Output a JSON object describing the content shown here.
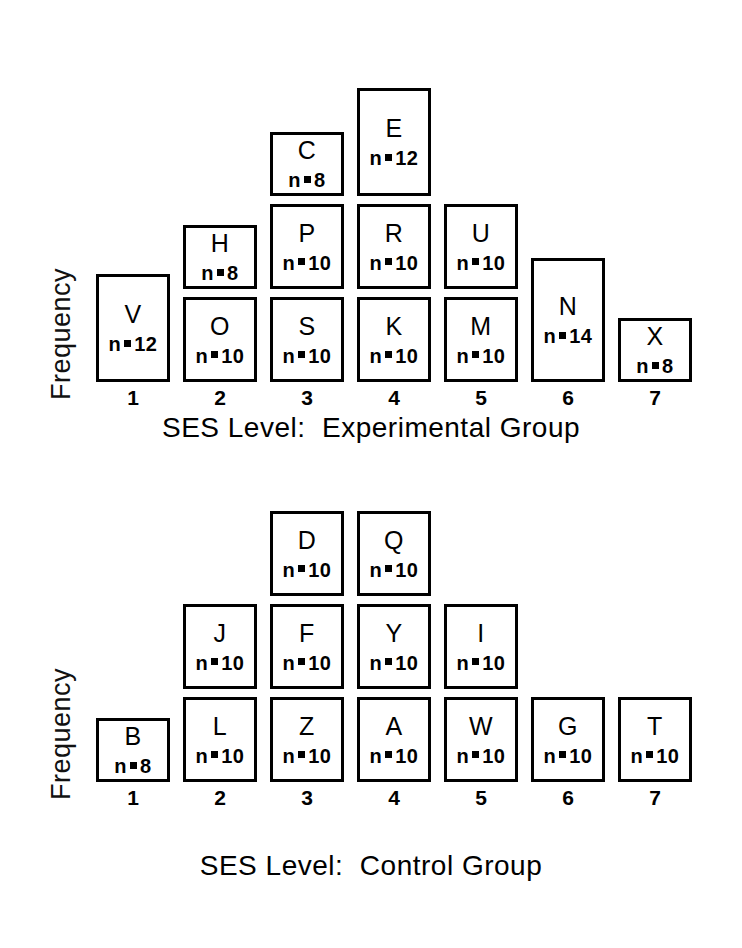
{
  "figure": {
    "background": "#ffffff",
    "ink_color": "#000000"
  },
  "panels": [
    {
      "id": "experimental",
      "ylabel": "Frequency",
      "caption": "SES Level:  Experimental Group",
      "tick_labels": [
        "1",
        "2",
        "3",
        "4",
        "5",
        "6",
        "7"
      ],
      "columns": [
        {
          "level": "1",
          "boxes": [
            {
              "letter": "V",
              "n_prefix": "n",
              "n_value": "12"
            }
          ]
        },
        {
          "level": "2",
          "boxes": [
            {
              "letter": "H",
              "n_prefix": "n",
              "n_value": "8"
            },
            {
              "letter": "O",
              "n_prefix": "n",
              "n_value": "10"
            }
          ]
        },
        {
          "level": "3",
          "boxes": [
            {
              "letter": "C",
              "n_prefix": "n",
              "n_value": "8"
            },
            {
              "letter": "P",
              "n_prefix": "n",
              "n_value": "10"
            },
            {
              "letter": "S",
              "n_prefix": "n",
              "n_value": "10"
            }
          ]
        },
        {
          "level": "4",
          "boxes": [
            {
              "letter": "E",
              "n_prefix": "n",
              "n_value": "12"
            },
            {
              "letter": "R",
              "n_prefix": "n",
              "n_value": "10"
            },
            {
              "letter": "K",
              "n_prefix": "n",
              "n_value": "10"
            }
          ]
        },
        {
          "level": "5",
          "boxes": [
            {
              "letter": "U",
              "n_prefix": "n",
              "n_value": "10"
            },
            {
              "letter": "M",
              "n_prefix": "n",
              "n_value": "10"
            }
          ]
        },
        {
          "level": "6",
          "boxes": [
            {
              "letter": "N",
              "n_prefix": "n",
              "n_value": "14"
            }
          ]
        },
        {
          "level": "7",
          "boxes": [
            {
              "letter": "X",
              "n_prefix": "n",
              "n_value": "8"
            }
          ]
        }
      ]
    },
    {
      "id": "control",
      "ylabel": "Frequency",
      "caption": "SES Level:  Control Group",
      "tick_labels": [
        "1",
        "2",
        "3",
        "4",
        "5",
        "6",
        "7"
      ],
      "columns": [
        {
          "level": "1",
          "boxes": [
            {
              "letter": "B",
              "n_prefix": "n",
              "n_value": "8"
            }
          ]
        },
        {
          "level": "2",
          "boxes": [
            {
              "letter": "J",
              "n_prefix": "n",
              "n_value": "10"
            },
            {
              "letter": "L",
              "n_prefix": "n",
              "n_value": "10"
            }
          ]
        },
        {
          "level": "3",
          "boxes": [
            {
              "letter": "D",
              "n_prefix": "n",
              "n_value": "10"
            },
            {
              "letter": "F",
              "n_prefix": "n",
              "n_value": "10"
            },
            {
              "letter": "Z",
              "n_prefix": "n",
              "n_value": "10"
            }
          ]
        },
        {
          "level": "4",
          "boxes": [
            {
              "letter": "Q",
              "n_prefix": "n",
              "n_value": "10"
            },
            {
              "letter": "Y",
              "n_prefix": "n",
              "n_value": "10"
            },
            {
              "letter": "A",
              "n_prefix": "n",
              "n_value": "10"
            }
          ]
        },
        {
          "level": "5",
          "boxes": [
            {
              "letter": "I",
              "n_prefix": "n",
              "n_value": "10"
            },
            {
              "letter": "W",
              "n_prefix": "n",
              "n_value": "10"
            }
          ]
        },
        {
          "level": "6",
          "boxes": [
            {
              "letter": "G",
              "n_prefix": "n",
              "n_value": "10"
            }
          ]
        },
        {
          "level": "7",
          "boxes": [
            {
              "letter": "T",
              "n_prefix": "n",
              "n_value": "10"
            }
          ]
        }
      ]
    }
  ],
  "chart_data": {
    "type": "bar",
    "title": "",
    "subtitle": "",
    "xlabel": "SES Level",
    "ylabel": "Frequency",
    "grid": false,
    "legend": "none",
    "note": "Two stacked-block frequency charts. Each block is a labelled group (letter code) whose height is proportional to its n. Blocks stack upward from a shared baseline within each SES level column.",
    "categories": [
      "1",
      "2",
      "3",
      "4",
      "5",
      "6",
      "7"
    ],
    "panels": [
      {
        "name": "SES Level:  Experimental Group",
        "xlabel": "SES Level",
        "ylabel": "Frequency",
        "categories": [
          "1",
          "2",
          "3",
          "4",
          "5",
          "6",
          "7"
        ],
        "stacked_totals": [
          12,
          18,
          28,
          32,
          20,
          14,
          8
        ],
        "blocks_by_category": [
          [
            {
              "label": "V",
              "n": 12
            }
          ],
          [
            {
              "label": "O",
              "n": 10
            },
            {
              "label": "H",
              "n": 8
            }
          ],
          [
            {
              "label": "S",
              "n": 10
            },
            {
              "label": "P",
              "n": 10
            },
            {
              "label": "C",
              "n": 8
            }
          ],
          [
            {
              "label": "K",
              "n": 10
            },
            {
              "label": "R",
              "n": 10
            },
            {
              "label": "E",
              "n": 12
            }
          ],
          [
            {
              "label": "M",
              "n": 10
            },
            {
              "label": "U",
              "n": 10
            }
          ],
          [
            {
              "label": "N",
              "n": 14
            }
          ],
          [
            {
              "label": "X",
              "n": 8
            }
          ]
        ]
      },
      {
        "name": "SES Level:  Control Group",
        "xlabel": "SES Level",
        "ylabel": "Frequency",
        "categories": [
          "1",
          "2",
          "3",
          "4",
          "5",
          "6",
          "7"
        ],
        "stacked_totals": [
          8,
          20,
          30,
          30,
          20,
          10,
          10
        ],
        "blocks_by_category": [
          [
            {
              "label": "B",
              "n": 8
            }
          ],
          [
            {
              "label": "L",
              "n": 10
            },
            {
              "label": "J",
              "n": 10
            }
          ],
          [
            {
              "label": "Z",
              "n": 10
            },
            {
              "label": "F",
              "n": 10
            },
            {
              "label": "D",
              "n": 10
            }
          ],
          [
            {
              "label": "A",
              "n": 10
            },
            {
              "label": "Y",
              "n": 10
            },
            {
              "label": "Q",
              "n": 10
            }
          ],
          [
            {
              "label": "W",
              "n": 10
            },
            {
              "label": "I",
              "n": 10
            }
          ],
          [
            {
              "label": "G",
              "n": 10
            }
          ],
          [
            {
              "label": "T",
              "n": 10
            }
          ]
        ]
      }
    ]
  }
}
